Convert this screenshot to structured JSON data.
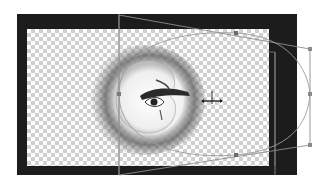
{
  "app": {
    "view": "image-editor-canvas",
    "tool_mode": "warp-transform"
  },
  "document": {
    "background": "transparent-checkerboard",
    "layer_content": "eye-photo-with-feathered-vignette"
  },
  "transform": {
    "handles": [
      {
        "name": "top-handle",
        "x": 236,
        "y": 33
      },
      {
        "name": "top-right-handle",
        "x": 310,
        "y": 49
      },
      {
        "name": "right-handle",
        "x": 310,
        "y": 94
      },
      {
        "name": "bottom-right-handle",
        "x": 310,
        "y": 145
      },
      {
        "name": "bottom-handle",
        "x": 236,
        "y": 155
      },
      {
        "name": "left-handle",
        "x": 119,
        "y": 94
      }
    ],
    "pivot": {
      "x": 212,
      "y": 101
    }
  },
  "colors": {
    "frame": "#1c1c1c",
    "guide": "#9a9a9a",
    "checker_dark": "#cfcfcf",
    "checker_light": "#ffffff",
    "handle": "#6a6a6a"
  }
}
